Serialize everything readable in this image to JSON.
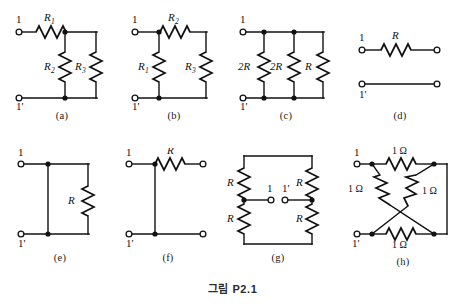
{
  "figure": {
    "caption": "그림 P2.1",
    "subfigures": [
      {
        "id": "a",
        "caption": "(a)",
        "terminal_top": "1",
        "terminal_bottom": "1'",
        "resistors": [
          {
            "name": "R",
            "sub": "1",
            "orientation": "horizontal",
            "position": "top-series"
          },
          {
            "name": "R",
            "sub": "2",
            "orientation": "vertical",
            "position": "middle-shunt"
          },
          {
            "name": "R",
            "sub": "3",
            "orientation": "vertical",
            "position": "right-shunt"
          }
        ]
      },
      {
        "id": "b",
        "caption": "(b)",
        "terminal_top": "1",
        "terminal_bottom": "1'",
        "resistors": [
          {
            "name": "R",
            "sub": "2",
            "orientation": "horizontal",
            "position": "top-series"
          },
          {
            "name": "R",
            "sub": "1",
            "orientation": "vertical",
            "position": "left-shunt"
          },
          {
            "name": "R",
            "sub": "3",
            "orientation": "vertical",
            "position": "right-shunt"
          }
        ]
      },
      {
        "id": "c",
        "caption": "(c)",
        "terminal_top": "1",
        "terminal_bottom": "1'",
        "resistors": [
          {
            "name": "2R",
            "sub": "",
            "orientation": "vertical",
            "position": "left-shunt"
          },
          {
            "name": "2R",
            "sub": "",
            "orientation": "vertical",
            "position": "middle-shunt"
          },
          {
            "name": "R",
            "sub": "",
            "orientation": "vertical",
            "position": "right-shunt"
          }
        ]
      },
      {
        "id": "d",
        "caption": "(d)",
        "terminal_top": "1",
        "terminal_bottom": "1'",
        "resistors": [
          {
            "name": "R",
            "sub": "",
            "orientation": "horizontal",
            "position": "top-series"
          }
        ]
      },
      {
        "id": "e",
        "caption": "(e)",
        "terminal_top": "1",
        "terminal_bottom": "1'",
        "resistors": [
          {
            "name": "R",
            "sub": "",
            "orientation": "vertical",
            "position": "right-shunt"
          }
        ]
      },
      {
        "id": "f",
        "caption": "(f)",
        "terminal_top": "1",
        "terminal_bottom": "1'",
        "resistors": [
          {
            "name": "R",
            "sub": "",
            "orientation": "horizontal",
            "position": "top-right-series"
          }
        ]
      },
      {
        "id": "g",
        "caption": "(g)",
        "terminal_top": "1",
        "terminal_bottom": "1'",
        "resistors": [
          {
            "name": "R",
            "sub": "",
            "orientation": "vertical",
            "position": "top-left"
          },
          {
            "name": "R",
            "sub": "",
            "orientation": "vertical",
            "position": "top-right"
          },
          {
            "name": "R",
            "sub": "",
            "orientation": "vertical",
            "position": "bottom-left"
          },
          {
            "name": "R",
            "sub": "",
            "orientation": "vertical",
            "position": "bottom-right"
          }
        ]
      },
      {
        "id": "h",
        "caption": "(h)",
        "terminal_top": "1",
        "terminal_bottom": "1'",
        "resistors": [
          {
            "name": "1 Ω",
            "sub": "",
            "orientation": "horizontal",
            "position": "top"
          },
          {
            "name": "1 Ω",
            "sub": "",
            "orientation": "diagonal",
            "position": "left-diagonal"
          },
          {
            "name": "1 Ω",
            "sub": "",
            "orientation": "diagonal",
            "position": "right-diagonal"
          },
          {
            "name": "1 Ω",
            "sub": "",
            "orientation": "horizontal",
            "position": "bottom"
          }
        ]
      }
    ]
  },
  "labels": {
    "a": {
      "caption": "(a)",
      "t1": "1",
      "t2": "1'",
      "r1": "R",
      "r1s": "1",
      "r2": "R",
      "r2s": "2",
      "r3": "R",
      "r3s": "3"
    },
    "b": {
      "caption": "(b)",
      "t1": "1",
      "t2": "1'",
      "r1": "R",
      "r1s": "2",
      "r2": "R",
      "r2s": "1",
      "r3": "R",
      "r3s": "3"
    },
    "c": {
      "caption": "(c)",
      "t1": "1",
      "t2": "1'",
      "r1": "2R",
      "r2": "2R",
      "r3": "R"
    },
    "d": {
      "caption": "(d)",
      "t1": "1",
      "t2": "1'",
      "r1": "R"
    },
    "e": {
      "caption": "(e)",
      "t1": "1",
      "t2": "1'",
      "r1": "R"
    },
    "f": {
      "caption": "(f)",
      "t1": "1",
      "t2": "1'",
      "r1": "R"
    },
    "g": {
      "caption": "(g)",
      "t1": "1",
      "t2": "1'",
      "r1": "R",
      "r2": "R",
      "r3": "R",
      "r4": "R"
    },
    "h": {
      "caption": "(h)",
      "t1": "1",
      "t2": "1'",
      "r1": "1 Ω",
      "r2": "1 Ω",
      "r3": "1 Ω",
      "r4": "1 Ω"
    }
  },
  "colors": {
    "ink": "#111111",
    "background": "#ffffff",
    "caption": "#2b2b2b"
  }
}
